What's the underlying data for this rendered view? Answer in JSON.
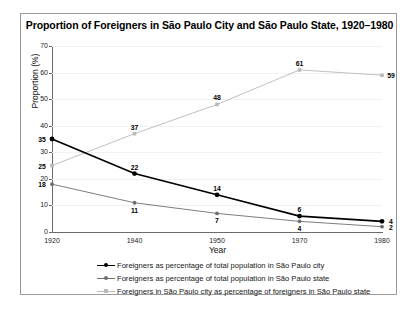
{
  "chart_data": {
    "type": "line",
    "title": "Proportion of Foreigners in São Paulo City and São Paulo State, 1920–1980",
    "xlabel": "Year",
    "ylabel": "Proportion (%)",
    "categories": [
      "1920",
      "1940",
      "1950",
      "1970",
      "1980"
    ],
    "ylim": [
      0,
      70
    ],
    "yticks": [
      0,
      10,
      20,
      30,
      40,
      50,
      60,
      70
    ],
    "grid": true,
    "legend_position": "bottom",
    "series": [
      {
        "name": "Foreigners as percentage of total population in São Paulo city",
        "color": "#000000",
        "marker": "circle",
        "values": [
          35,
          22,
          14,
          6,
          4
        ]
      },
      {
        "name": "Foreigners as percentage of total population in São Paulo state",
        "color": "#6e6e6e",
        "marker": "circle",
        "values": [
          18,
          11,
          7,
          4,
          2
        ]
      },
      {
        "name": "Foreigners in São Paulo city as percentage of foreigners in São Paulo state",
        "color": "#b9b9b9",
        "marker": "square",
        "values": [
          25,
          37,
          48,
          61,
          59
        ]
      }
    ]
  }
}
